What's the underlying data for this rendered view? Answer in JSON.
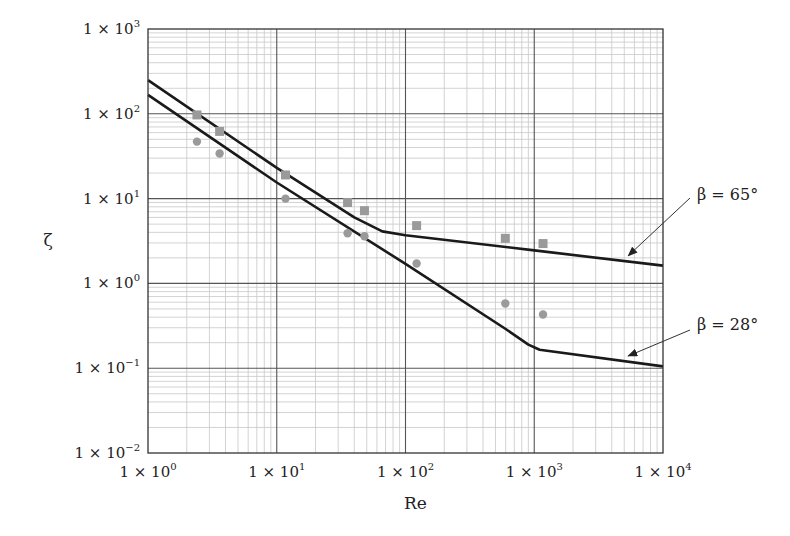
{
  "chart_data": {
    "type": "line",
    "title": "",
    "xlabel": "Re",
    "ylabel": "ζ",
    "xscale": "log",
    "yscale": "log",
    "xlim": [
      1,
      10000
    ],
    "ylim": [
      0.01,
      1000
    ],
    "grid": true,
    "x_ticks": [
      {
        "value": 1,
        "label": "1 × 10",
        "exp": "0"
      },
      {
        "value": 10,
        "label": "1 × 10",
        "exp": "1"
      },
      {
        "value": 100,
        "label": "1 × 10",
        "exp": "2"
      },
      {
        "value": 1000,
        "label": "1 × 10",
        "exp": "3"
      },
      {
        "value": 10000,
        "label": "1 × 10",
        "exp": "4"
      }
    ],
    "y_ticks": [
      {
        "value": 0.01,
        "label": "1 × 10",
        "exp": "−2"
      },
      {
        "value": 0.1,
        "label": "1 × 10",
        "exp": "−1"
      },
      {
        "value": 1,
        "label": "1 × 10",
        "exp": "0"
      },
      {
        "value": 10,
        "label": "1 × 10",
        "exp": "1"
      },
      {
        "value": 100,
        "label": "1 × 10",
        "exp": "2"
      },
      {
        "value": 1000,
        "label": "1 × 10",
        "exp": "3"
      }
    ],
    "series": [
      {
        "name": "β = 65° (model)",
        "kind": "line",
        "color": "#1a1a1a",
        "points": [
          [
            1,
            250
          ],
          [
            10,
            23
          ],
          [
            40,
            6.0
          ],
          [
            66,
            4.1
          ],
          [
            100,
            3.7
          ],
          [
            1000,
            2.45
          ],
          [
            10000,
            1.62
          ]
        ]
      },
      {
        "name": "β = 28° (model)",
        "kind": "line",
        "color": "#1a1a1a",
        "points": [
          [
            1,
            167
          ],
          [
            10,
            15.5
          ],
          [
            100,
            1.7
          ],
          [
            600,
            0.29
          ],
          [
            900,
            0.19
          ],
          [
            1100,
            0.165
          ],
          [
            10000,
            0.105
          ]
        ]
      },
      {
        "name": "β = 65° (data)",
        "kind": "scatter",
        "marker": "square",
        "color": "#9a9a9a",
        "points": [
          [
            2.4,
            97
          ],
          [
            3.6,
            62
          ],
          [
            11.7,
            19
          ],
          [
            35.5,
            9.0
          ],
          [
            48,
            7.2
          ],
          [
            122,
            4.8
          ],
          [
            596,
            3.4
          ],
          [
            1170,
            2.95
          ]
        ]
      },
      {
        "name": "β = 28° (data)",
        "kind": "scatter",
        "marker": "circle",
        "color": "#9a9a9a",
        "points": [
          [
            2.4,
            47
          ],
          [
            3.6,
            34
          ],
          [
            11.7,
            10
          ],
          [
            35.5,
            3.9
          ],
          [
            48,
            3.6
          ],
          [
            122,
            1.72
          ],
          [
            596,
            0.58
          ],
          [
            1170,
            0.43
          ]
        ]
      }
    ],
    "annotations": [
      {
        "text": "β = 65°",
        "arrow_to": [
          5000,
          1.9
        ]
      },
      {
        "text": "β = 28°",
        "arrow_to": [
          5000,
          0.125
        ]
      }
    ]
  }
}
